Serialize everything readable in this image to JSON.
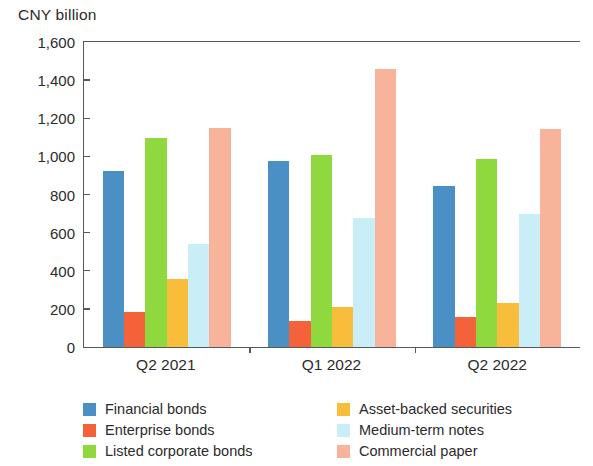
{
  "chart_data": {
    "type": "bar",
    "title": "",
    "ylabel": "CNY billion",
    "xlabel": "",
    "ylim": [
      0,
      1600
    ],
    "ytick_step": 200,
    "yticks": [
      "1,600",
      "1,400",
      "1,200",
      "1,000",
      "800",
      "600",
      "400",
      "200",
      "0"
    ],
    "ytick_values": [
      1600,
      1400,
      1200,
      1000,
      800,
      600,
      400,
      200,
      0
    ],
    "grid": false,
    "legend_position": "bottom",
    "categories": [
      "Q2 2021",
      "Q1 2022",
      "Q2 2022"
    ],
    "series": [
      {
        "name": "Financial bonds",
        "color": "#4a90c4",
        "values": [
          925,
          978,
          845
        ]
      },
      {
        "name": "Enterprise bonds",
        "color": "#f4623a",
        "values": [
          185,
          137,
          157
        ]
      },
      {
        "name": "Listed corporate bonds",
        "color": "#8fd93f",
        "values": [
          1095,
          1007,
          988
        ]
      },
      {
        "name": "Asset-backed securities",
        "color": "#f7bd3b",
        "values": [
          358,
          208,
          232
        ]
      },
      {
        "name": "Medium-term notes",
        "color": "#c9eef7",
        "values": [
          540,
          675,
          698
        ]
      },
      {
        "name": "Commercial paper",
        "color": "#f7b49a",
        "values": [
          1148,
          1460,
          1143
        ]
      }
    ]
  },
  "legend": {
    "column_left": [
      "Financial bonds",
      "Enterprise bonds",
      "Listed corporate bonds"
    ],
    "column_right": [
      "Asset-backed securities",
      "Medium-term notes",
      "Commercial paper"
    ]
  },
  "colors": {
    "axis": "#58585b",
    "text": "#2b2b2b",
    "background": "#ffffff"
  }
}
